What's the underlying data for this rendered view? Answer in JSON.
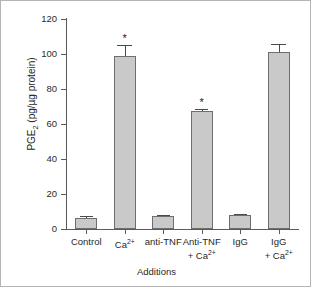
{
  "chart_data": {
    "type": "bar",
    "title": "",
    "xlabel": "Additions",
    "ylabel": "PGE2 (pg/µg protein)",
    "ylabel_parts": {
      "prefix": "PGE",
      "subscript": "2",
      "suffix": " (pg/µg protein)"
    },
    "categories": [
      "Control",
      "Ca2+",
      "anti-TNF",
      "Anti-TNF + Ca2+",
      "IgG",
      "IgG + Ca2+"
    ],
    "category_labels": [
      {
        "line1": "Control",
        "line1_sup": "",
        "line2": "",
        "line2_sup": ""
      },
      {
        "line1": "Ca",
        "line1_sup": "2+",
        "line2": "",
        "line2_sup": ""
      },
      {
        "line1": "anti-TNF",
        "line1_sup": "",
        "line2": "",
        "line2_sup": ""
      },
      {
        "line1": "Anti-TNF",
        "line1_sup": "",
        "line2": "+ Ca",
        "line2_sup": "2+"
      },
      {
        "line1": "IgG",
        "line1_sup": "",
        "line2": "",
        "line2_sup": ""
      },
      {
        "line1": "IgG",
        "line1_sup": "",
        "line2": "+ Ca",
        "line2_sup": "2+"
      }
    ],
    "values": [
      6.5,
      99,
      7.5,
      67.5,
      7.8,
      101
    ],
    "errors": [
      1.2,
      6.0,
      0.6,
      1.2,
      0.6,
      4.5
    ],
    "significance": [
      "",
      "*",
      "",
      "*",
      "",
      ""
    ],
    "yticks": [
      0,
      20,
      40,
      60,
      80,
      100,
      120
    ],
    "ylim": [
      0,
      120
    ],
    "grid": false,
    "legend": "none",
    "bar_fill": "#c9c9c9",
    "bar_edge": "#6e6e6e",
    "axis_color": "#5a5a5a"
  }
}
